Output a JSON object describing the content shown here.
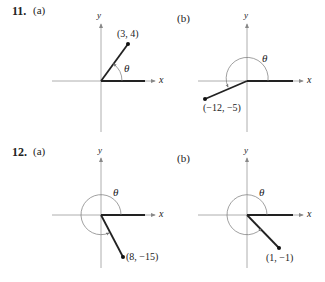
{
  "problems": [
    {
      "number": "11.",
      "parts": [
        {
          "label": "(a)",
          "point_label": "(3, 4)",
          "point": [
            3,
            4
          ],
          "angle_label": "θ",
          "axis_x": "x",
          "axis_y": "y",
          "angle_sweep": "counterclockwise, first quadrant"
        },
        {
          "label": "(b)",
          "point_label": "(−12, −5)",
          "point": [
            -12,
            -5
          ],
          "angle_label": "θ",
          "axis_x": "x",
          "axis_y": "y",
          "angle_sweep": "counterclockwise, third quadrant"
        }
      ]
    },
    {
      "number": "12.",
      "parts": [
        {
          "label": "(a)",
          "point_label": "(8, −15)",
          "point": [
            8,
            -15
          ],
          "angle_label": "θ",
          "axis_x": "x",
          "axis_y": "y",
          "angle_sweep": "counterclockwise, fourth quadrant"
        },
        {
          "label": "(b)",
          "point_label": "(1, −1)",
          "point": [
            1,
            -1
          ],
          "angle_label": "θ",
          "axis_x": "x",
          "axis_y": "y",
          "angle_sweep": "counterclockwise, fourth quadrant"
        }
      ]
    }
  ]
}
